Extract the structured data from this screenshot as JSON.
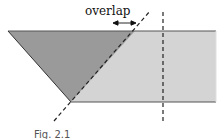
{
  "diagram": {
    "overlap_label": "overlap",
    "caption": "Fig. 2.1",
    "colors": {
      "dark_fill": "#9a9a9a",
      "light_fill": "#d4d4d4",
      "stroke": "#444444",
      "dashed": "#222222",
      "text": "#111111"
    },
    "shapes": {
      "band": {
        "top_y": 31,
        "bottom_y": 102,
        "right_x": 216
      },
      "dark_triangle": [
        [
          8,
          31
        ],
        [
          135,
          31
        ],
        [
          71,
          102
        ]
      ],
      "diagonal_dashed_line": {
        "from": [
          54,
          121
        ],
        "to": [
          150,
          11
        ]
      },
      "vertical_dashed_line": {
        "x": 163,
        "from_y": 12,
        "to_y": 121
      },
      "overlap_arrow": {
        "from_x": 114,
        "to_x": 135,
        "y": 23
      }
    }
  }
}
